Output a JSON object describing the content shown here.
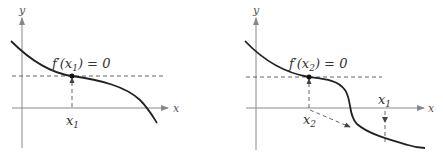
{
  "figures": [
    {
      "id": "left",
      "axis_x_label": "x",
      "axis_y_label": "y",
      "annotation": "f′(x",
      "annotation_sub": "1",
      "annotation_tail": ") = 0",
      "point_label": "x",
      "point_label_sub": "1"
    },
    {
      "id": "right",
      "axis_x_label": "x",
      "axis_y_label": "y",
      "annotation": "f′(x",
      "annotation_sub": "2",
      "annotation_tail": ") = 0",
      "point_label_a": "x",
      "point_label_a_sub": "2",
      "point_label_b": "x",
      "point_label_b_sub": "1"
    }
  ],
  "colors": {
    "curve": "#222222",
    "axis": "#777777",
    "dashed": "#555555"
  }
}
